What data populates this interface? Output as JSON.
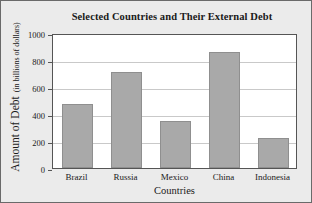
{
  "chart_data": {
    "type": "bar",
    "title": "Selected Countries and Their External Debt",
    "xlabel": "Countries",
    "ylabel": "Amount of Debt",
    "ylabel_units": "(in billions of dollars)",
    "categories": [
      "Brazil",
      "Russia",
      "Mexico",
      "China",
      "Indonesia"
    ],
    "values": [
      475,
      710,
      350,
      860,
      220
    ],
    "ylim": [
      0,
      1000
    ],
    "yticks": [
      0,
      200,
      400,
      600,
      800,
      1000
    ],
    "ytick_labels": [
      "0",
      "200",
      "400",
      "600",
      "800",
      "1000"
    ],
    "grid": true,
    "legend": null,
    "bar_color": "#a9a9a9",
    "bar_edge_color": "#8f8f8f",
    "grid_color": "#c9c9c9",
    "axis_color": "#555555",
    "plot_background": "#ffffff",
    "figure_background": "#ebebeb"
  }
}
